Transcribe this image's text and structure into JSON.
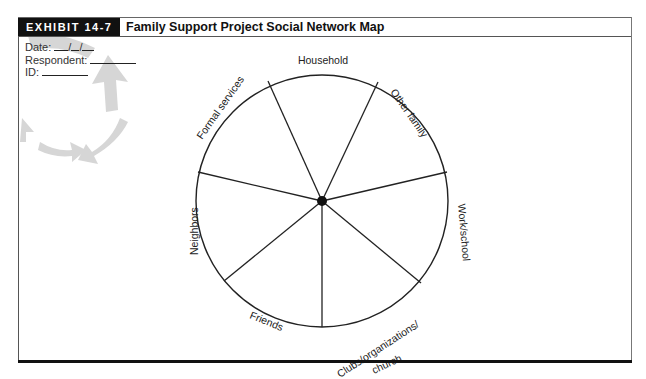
{
  "header": {
    "badge": "EXHIBIT 14-7",
    "title": "Family Support Project Social Network Map"
  },
  "form_fields": [
    {
      "label": "Date:",
      "value": "__/__/__"
    },
    {
      "label": "Respondent:",
      "value": ""
    },
    {
      "label": "ID:",
      "value": ""
    }
  ],
  "diagram": {
    "type": "pie-wheel",
    "center_node": "respondent",
    "segments": [
      {
        "label": "Household"
      },
      {
        "label": "Other family"
      },
      {
        "label": "Work/school"
      },
      {
        "label": "Clubs/organizations/ church"
      },
      {
        "label": "Friends"
      },
      {
        "label": "Neighbors"
      },
      {
        "label": "Formal services"
      }
    ]
  },
  "labels": {
    "household": "Household",
    "other_family": "Other family",
    "work_school": "Work/school",
    "clubs_line1": "Clubs/organizations/",
    "clubs_line2": "church",
    "friends": "Friends",
    "neighbors": "Neighbors",
    "formal_services": "Formal services"
  },
  "colors": {
    "badge_bg": "#111111",
    "line": "#222222",
    "watermark": "#c8c8c8"
  }
}
